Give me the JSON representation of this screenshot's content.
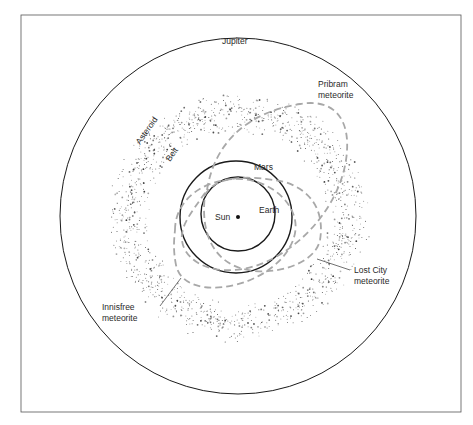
{
  "diagram": {
    "title": "",
    "bodies": {
      "sun": "Sun",
      "earth": "Earth",
      "mars": "Mars",
      "jupiter": "Jupiter"
    },
    "asteroid_belt": [
      "Asteroid",
      "Belt"
    ],
    "meteorites": {
      "pribram": [
        "Pribram",
        "meteorite"
      ],
      "lost_city": [
        "Lost City",
        "meteorite"
      ],
      "innisfree": [
        "Innisfree",
        "meteorite"
      ]
    },
    "colors": {
      "orbit": "#1a1a1a",
      "meteorite_orbit": "#a8a8a8",
      "belt_dots": "#333333",
      "frame": "#555555"
    }
  }
}
